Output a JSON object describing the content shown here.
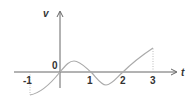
{
  "diagram": {
    "type": "waveform-graph",
    "axes": {
      "vertical_label": "v",
      "horizontal_label": "t",
      "origin_label": "0"
    },
    "tick_labels": [
      "-1",
      "1",
      "2",
      "3"
    ],
    "curve": {
      "description": "sinusoid-like waveform from t=-1 to t=3, with dotted vertical lines at t=-1 and t=3",
      "t_range": [
        -1,
        3
      ],
      "zero_crossings": [
        0,
        1,
        2
      ],
      "peak_near_t": 0.5,
      "trough_near_t": 1.5
    },
    "colors": {
      "axis": "#666666",
      "curve": "#aaaaaa",
      "text": "#333333"
    }
  }
}
